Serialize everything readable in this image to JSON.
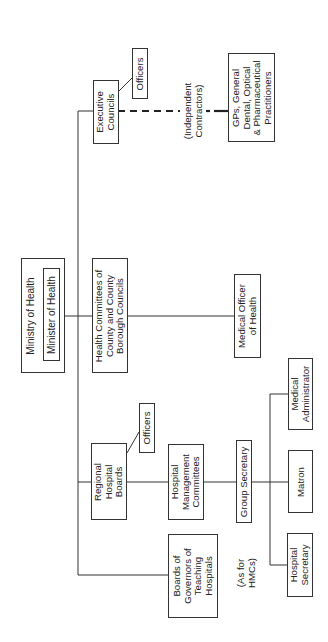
{
  "diagram": {
    "orientation": "rotated-90-ccw",
    "nodes": {
      "ministry": "Ministry of Health",
      "minister": "Minister of Health",
      "executive_councils": "Executive\nCouncils",
      "ec_officers": "Officers",
      "gps": "GPs, General\nDental, Optical\n& Pharmaceutical\nPractitioners",
      "independent_contractors": "(Independent\nContractors)",
      "health_committees": "Health Committees of\nCounty and County\nBorough Councils",
      "medical_officer": "Medical Officer\nof Health",
      "regional_boards": "Regional\nHospital\nBoards",
      "rhb_officers": "Officers",
      "hmc": "Hospital\nManagement\nCommittees",
      "group_secretary": "Group Secretary",
      "medical_administrator": "Medical\nAdministrator",
      "matron": "Matron",
      "hospital_secretary": "Hospital\nSecretary",
      "boards_governors": "Boards of\nGovernors of\nTeaching\nHospitals",
      "as_for_hmcs": "(As for\nHMCs)"
    },
    "edges": [
      {
        "from": "ministry",
        "to": "executive_councils",
        "style": "solid"
      },
      {
        "from": "ministry",
        "to": "health_committees",
        "style": "solid"
      },
      {
        "from": "ministry",
        "to": "regional_boards",
        "style": "solid"
      },
      {
        "from": "ministry",
        "to": "boards_governors",
        "style": "solid"
      },
      {
        "from": "executive_councils",
        "to": "ec_officers",
        "style": "solid"
      },
      {
        "from": "executive_councils",
        "to": "gps",
        "style": "dashed",
        "label": "(Independent Contractors)"
      },
      {
        "from": "health_committees",
        "to": "medical_officer",
        "style": "solid"
      },
      {
        "from": "regional_boards",
        "to": "rhb_officers",
        "style": "solid"
      },
      {
        "from": "regional_boards",
        "to": "hmc",
        "style": "solid"
      },
      {
        "from": "hmc",
        "to": "group_secretary",
        "style": "solid"
      },
      {
        "from": "group_secretary",
        "to": "medical_administrator",
        "style": "solid"
      },
      {
        "from": "group_secretary",
        "to": "matron",
        "style": "solid"
      },
      {
        "from": "group_secretary",
        "to": "hospital_secretary",
        "style": "solid"
      }
    ],
    "colors": {
      "line": "#333333",
      "text": "#222222",
      "background": "#ffffff"
    }
  }
}
